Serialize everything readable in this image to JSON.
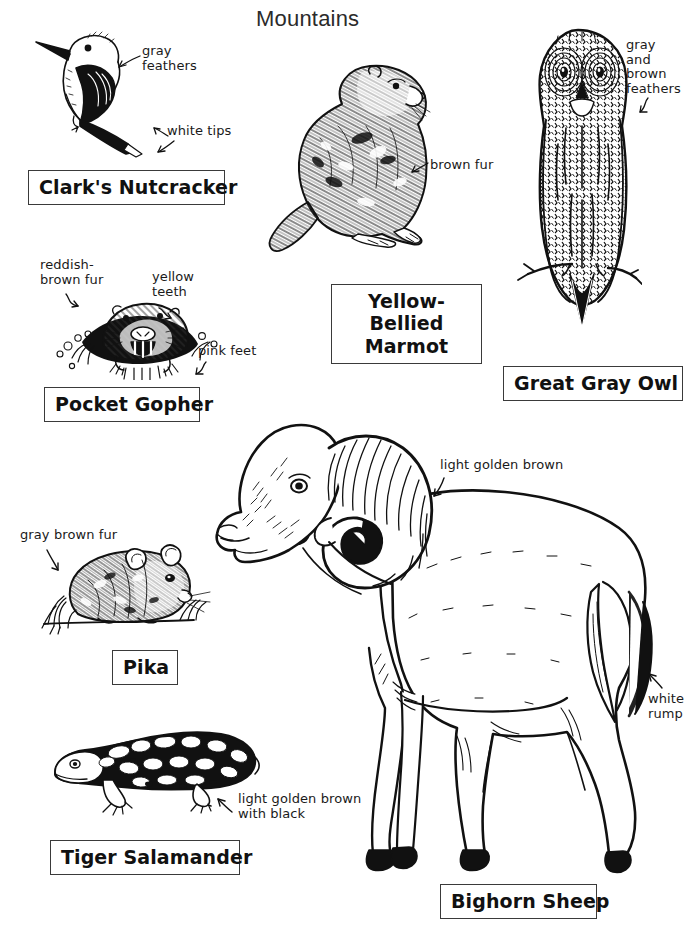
{
  "page": {
    "title": "Mountains",
    "background": "#ffffff",
    "ink": "#111111",
    "width": 692,
    "height": 929
  },
  "species": [
    {
      "id": "clarks-nutcracker",
      "name": "Clark's Nutcracker",
      "annotations": [
        {
          "id": "gray-feathers",
          "text": "gray\nfeathers"
        },
        {
          "id": "white-tips",
          "text": "white tips"
        }
      ]
    },
    {
      "id": "yellow-bellied-marmot",
      "name": "Yellow-Bellied Marmot",
      "name_line_1": "Yellow-Bellied",
      "name_line_2": "Marmot",
      "annotations": [
        {
          "id": "brown-fur",
          "text": "brown fur"
        }
      ]
    },
    {
      "id": "great-gray-owl",
      "name": "Great Gray Owl",
      "annotations": [
        {
          "id": "gray-and-brown-feathers",
          "text": "gray\nand\nbrown\nfeathers"
        }
      ]
    },
    {
      "id": "pocket-gopher",
      "name": "Pocket Gopher",
      "annotations": [
        {
          "id": "reddish-brown-fur",
          "text": "reddish-\nbrown fur"
        },
        {
          "id": "yellow-teeth",
          "text": "yellow\nteeth"
        },
        {
          "id": "pink-feet",
          "text": "pink feet"
        }
      ]
    },
    {
      "id": "pika",
      "name": "Pika",
      "annotations": [
        {
          "id": "gray-brown-fur",
          "text": "gray brown fur"
        }
      ]
    },
    {
      "id": "tiger-salamander",
      "name": "Tiger Salamander",
      "annotations": [
        {
          "id": "light-golden-brown-with-black",
          "text": "light golden brown\nwith black"
        }
      ]
    },
    {
      "id": "bighorn-sheep",
      "name": "Bighorn Sheep",
      "annotations": [
        {
          "id": "light-golden-brown",
          "text": "light golden brown"
        },
        {
          "id": "white-rump",
          "text": "white\nrump"
        }
      ]
    }
  ]
}
